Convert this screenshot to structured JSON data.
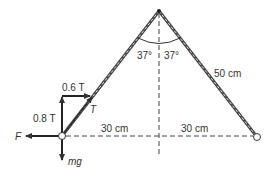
{
  "diagram": {
    "labels": {
      "angle_left": "37°",
      "angle_right": "37°",
      "string_length": "50 cm",
      "half_sep_left": "30 cm",
      "half_sep_right": "30 cm",
      "horizontal_tension": "0.6 T",
      "vertical_tension": "0.8 T",
      "tension": "T",
      "electric_force": "F",
      "weight": "mg"
    },
    "colors": {
      "line": "#333333",
      "string": "#555555",
      "background": "#ffffff"
    }
  }
}
